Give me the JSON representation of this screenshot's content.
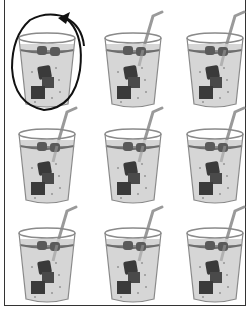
{
  "worksheet": {
    "layout": {
      "rows": 3,
      "columns": 3
    },
    "item_type": "glass-of-iced-drink",
    "items": [
      {
        "row": 1,
        "col": 1,
        "straw": false,
        "circled": true,
        "x": 12,
        "y": 10
      },
      {
        "row": 1,
        "col": 2,
        "straw": true,
        "circled": false,
        "x": 98,
        "y": 10
      },
      {
        "row": 1,
        "col": 3,
        "straw": true,
        "circled": false,
        "x": 180,
        "y": 10
      },
      {
        "row": 2,
        "col": 1,
        "straw": true,
        "circled": false,
        "x": 12,
        "y": 106
      },
      {
        "row": 2,
        "col": 2,
        "straw": true,
        "circled": false,
        "x": 98,
        "y": 106
      },
      {
        "row": 2,
        "col": 3,
        "straw": true,
        "circled": false,
        "x": 180,
        "y": 106
      },
      {
        "row": 3,
        "col": 1,
        "straw": true,
        "circled": false,
        "x": 12,
        "y": 205
      },
      {
        "row": 3,
        "col": 2,
        "straw": true,
        "circled": false,
        "x": 98,
        "y": 205
      },
      {
        "row": 3,
        "col": 3,
        "straw": true,
        "circled": false,
        "x": 180,
        "y": 205
      }
    ],
    "colors": {
      "liquid": "#cfcfcf",
      "glass_rim": "#8a8a8a",
      "ice": "#3a3a3a",
      "straw": "#9a9a9a",
      "circle": "#111111",
      "frame": "#333333"
    }
  }
}
